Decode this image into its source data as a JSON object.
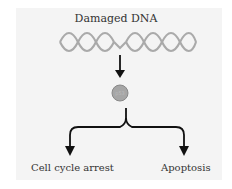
{
  "diagram": {
    "title": "Damaged DNA",
    "node": "p53",
    "outcomes": [
      "Cell cycle arrest",
      "Apoptosis"
    ],
    "colors": {
      "panel_bg": "#f4f4f4",
      "dna_strand": "#aaaaaa",
      "node_fill": "#a6a6a6",
      "arrow": "#111111"
    }
  }
}
